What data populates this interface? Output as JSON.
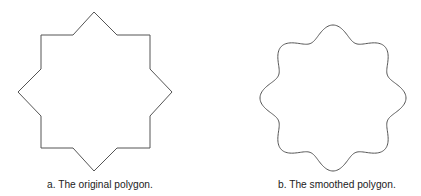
{
  "figures": [
    {
      "id": "a",
      "caption": "a. The original polygon.",
      "shape": "eight-pointed star polygon",
      "stroke": "#555555",
      "vertices": [
        [
          94,
          12
        ],
        [
          117,
          35
        ],
        [
          150,
          35
        ],
        [
          150,
          69
        ],
        [
          172,
          92
        ],
        [
          150,
          116
        ],
        [
          150,
          148
        ],
        [
          117,
          148
        ],
        [
          94,
          171
        ],
        [
          73,
          148
        ],
        [
          41,
          148
        ],
        [
          41,
          116
        ],
        [
          18,
          92
        ],
        [
          41,
          69
        ],
        [
          41,
          35
        ],
        [
          73,
          35
        ]
      ]
    },
    {
      "id": "b",
      "caption": "b. The smoothed polygon.",
      "shape": "smoothed eight-lobed curve",
      "stroke": "#555555",
      "center": [
        333,
        98
      ],
      "radius": 66,
      "wave_amplitude": 7,
      "lobes": 8
    }
  ]
}
